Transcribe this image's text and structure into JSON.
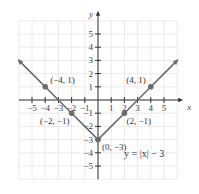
{
  "chart_data": {
    "type": "line",
    "title": "",
    "equation_label": "y = |x| − 3",
    "xlabel": "x",
    "ylabel": "y",
    "xlim": [
      -6,
      6
    ],
    "ylim": [
      -6,
      6
    ],
    "grid": true,
    "x_ticks": [
      -5,
      -4,
      -3,
      -2,
      -1,
      1,
      2,
      3,
      4,
      5
    ],
    "x_tick_labels": [
      "−5",
      "−4",
      "−3",
      "−2",
      "−1",
      "1",
      "2",
      "3",
      "4",
      "5"
    ],
    "y_ticks": [
      5,
      4,
      3,
      2,
      1,
      -1,
      -2,
      -3,
      -4,
      -5
    ],
    "y_tick_labels": [
      "5",
      "4",
      "3",
      "2",
      "1",
      "−1",
      "−2",
      "−3",
      "−4",
      "−5"
    ],
    "series": [
      {
        "name": "y = |x| − 3",
        "x": [
          -6,
          -5,
          -4,
          -3,
          -2,
          -1,
          0,
          1,
          2,
          3,
          4,
          5,
          6
        ],
        "y": [
          3,
          2,
          1,
          0,
          -1,
          -2,
          -3,
          -2,
          -1,
          0,
          1,
          2,
          3
        ],
        "color": "#6b6b6b"
      }
    ],
    "labeled_points": [
      {
        "x": -4,
        "y": 1,
        "label": "(−4, 1)"
      },
      {
        "x": 4,
        "y": 1,
        "label": "(4, 1)"
      },
      {
        "x": -2,
        "y": -1,
        "label": "(−2, −1)"
      },
      {
        "x": 2,
        "y": -1,
        "label": "(2, −1)"
      },
      {
        "x": 0,
        "y": -3,
        "label": "(0, −3)"
      }
    ]
  }
}
